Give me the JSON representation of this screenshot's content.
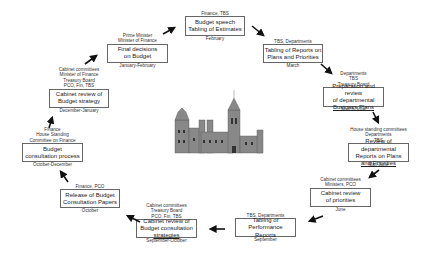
{
  "diagram": {
    "type": "budget-cycle",
    "center_image": "parliament-building-icon",
    "stages": [
      {
        "id": "budget-speech",
        "actors": [
          "Finance, TBS"
        ],
        "lines": [
          "Budget speech",
          "Tabling of Estimates"
        ],
        "period": "February"
      },
      {
        "id": "tabling-reports",
        "actors": [
          "TBS, Departments"
        ],
        "lines": [
          "Tabling of Reports on",
          "Plans and Priorities"
        ],
        "period": "March"
      },
      {
        "id": "business-plans",
        "actors": [
          "Departments",
          "TBS",
          "Treasury Board"
        ],
        "lines": [
          "Preparation and review",
          "of departmental",
          "Business Plans"
        ],
        "period": "March-June"
      },
      {
        "id": "review-reports",
        "actors": [
          "House standing committees",
          "Departments",
          "TBS"
        ],
        "lines": [
          "Review of departmental",
          "Reports on Plans",
          "and Priorities"
        ],
        "period": "May-June"
      },
      {
        "id": "cabinet-priorities",
        "actors": [
          "Cabinet committees",
          "Ministers, PCO"
        ],
        "lines": [
          "Cabinet review",
          "of priorities"
        ],
        "period": "June"
      },
      {
        "id": "performance-reports",
        "actors": [
          "TBS, Departments"
        ],
        "lines": [
          "Tabling of",
          "Performance",
          "Reports"
        ],
        "period": "September"
      },
      {
        "id": "cabinet-consultation",
        "actors": [
          "Cabinet committees",
          "Treasury Board",
          "PCO, Fin, TBS"
        ],
        "lines": [
          "Cabinet review of",
          "Budget consultation",
          "strategies"
        ],
        "period": "September-October"
      },
      {
        "id": "release-papers",
        "actors": [
          "Finance, PCO"
        ],
        "lines": [
          "Release of Budget",
          "Consultation Papers"
        ],
        "period": "October"
      },
      {
        "id": "consultation-process",
        "actors": [
          "Finance",
          "House Standing",
          "Committee on Finance"
        ],
        "lines": [
          "Budget",
          "consultation process"
        ],
        "period": "October-December"
      },
      {
        "id": "budget-strategy",
        "actors": [
          "Cabinet committees",
          "Minister of Finance",
          "Treasury Board",
          "PCO, Fin, TBS"
        ],
        "lines": [
          "Cabinet review of",
          "Budget strategy"
        ],
        "period": "December-January"
      },
      {
        "id": "final-decisions",
        "actors": [
          "Prime Minister",
          "Minister of Finance"
        ],
        "lines": [
          "Final decisions",
          "on Budget"
        ],
        "period": "January-February"
      }
    ]
  }
}
